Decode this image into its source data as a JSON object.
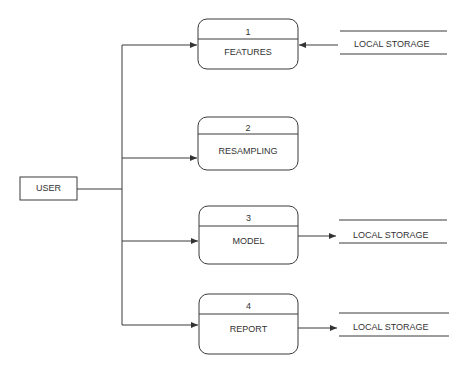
{
  "diagram": {
    "type": "data-flow-diagram",
    "entity": {
      "label": "USER"
    },
    "processes": [
      {
        "number": "1",
        "label": "FEATURES"
      },
      {
        "number": "2",
        "label": "RESAMPLING"
      },
      {
        "number": "3",
        "label": "MODEL"
      },
      {
        "number": "4",
        "label": "REPORT"
      }
    ],
    "stores": [
      {
        "label": "LOCAL STORAGE",
        "connects_to": "1",
        "direction": "store-to-process"
      },
      {
        "label": "LOCAL STORAGE",
        "connects_to": "3",
        "direction": "process-to-store"
      },
      {
        "label": "LOCAL STORAGE",
        "connects_to": "4",
        "direction": "process-to-store"
      }
    ],
    "colors": {
      "line": "#3a3a3a",
      "background": "#ffffff"
    }
  }
}
